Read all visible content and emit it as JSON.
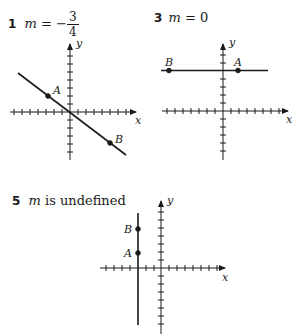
{
  "problems": [
    {
      "number": "1",
      "var": "m",
      "eq": "=",
      "sign": "−",
      "numerator": "3",
      "denominator": "4",
      "graph": {
        "x_label": "x",
        "y_label": "y",
        "points": [
          {
            "label": "A",
            "x": -3,
            "y": 2
          },
          {
            "label": "B",
            "x": 5,
            "y": -4
          }
        ],
        "line": "slope -3/4 through origin"
      }
    },
    {
      "number": "3",
      "var": "m",
      "text": "= 0",
      "graph": {
        "x_label": "x",
        "y_label": "y",
        "points": [
          {
            "label": "B",
            "x": -7,
            "y": 5
          },
          {
            "label": "A",
            "x": 2,
            "y": 5
          }
        ],
        "line": "horizontal y = 5"
      }
    },
    {
      "number": "5",
      "var": "m",
      "text": "is undefined",
      "graph": {
        "x_label": "x",
        "y_label": "y",
        "points": [
          {
            "label": "B",
            "x": -3,
            "y": 5
          },
          {
            "label": "A",
            "x": -3,
            "y": 2
          }
        ],
        "line": "vertical x = -3"
      }
    }
  ]
}
